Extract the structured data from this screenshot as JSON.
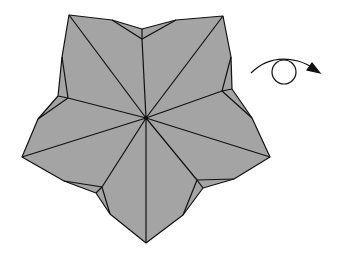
{
  "diagram": {
    "colors": {
      "fill": "#a4a4a4",
      "stroke": "#111111",
      "background": "#ffffff"
    },
    "center": [
      146,
      118
    ],
    "outline": [
      [
        69,
        15
      ],
      [
        112,
        20
      ],
      [
        142,
        29
      ],
      [
        176,
        20
      ],
      [
        223,
        16
      ],
      [
        231,
        57
      ],
      [
        232,
        89
      ],
      [
        252,
        118
      ],
      [
        270,
        157
      ],
      [
        234,
        179
      ],
      [
        203,
        188
      ],
      [
        183,
        215
      ],
      [
        146,
        243
      ],
      [
        110,
        214
      ],
      [
        96,
        193
      ],
      [
        64,
        181
      ],
      [
        22,
        157
      ],
      [
        38,
        119
      ],
      [
        58,
        96
      ],
      [
        62,
        57
      ]
    ],
    "inner_points": [
      [
        142,
        39
      ],
      [
        222,
        91
      ],
      [
        197,
        180
      ],
      [
        102,
        187
      ],
      [
        68,
        98
      ]
    ],
    "symbols": {
      "turn_over": "rotation-arrow-icon"
    }
  }
}
